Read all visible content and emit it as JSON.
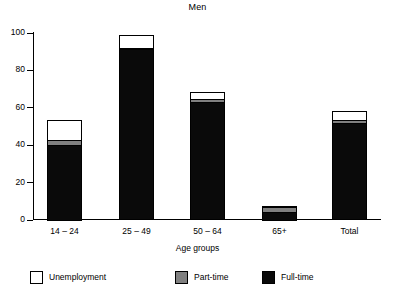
{
  "chart_data": {
    "type": "bar",
    "title": "Men",
    "xlabel": "Age groups",
    "ylabel": "",
    "ylim": [
      0,
      100
    ],
    "yticks": [
      0,
      20,
      40,
      60,
      80,
      100
    ],
    "ytick_labels": [
      "0",
      "20",
      "40",
      "60",
      "80",
      "100"
    ],
    "grid": false,
    "stacked": true,
    "legend_position": "bottom",
    "categories": [
      "14 – 24",
      "25 – 49",
      "50 – 64",
      "65+",
      "Total"
    ],
    "series": [
      {
        "name": "Full-time",
        "color": "#0a0a0a",
        "values": [
          40,
          91,
          63,
          4,
          51.5
        ]
      },
      {
        "name": "Part-time",
        "color": "#808080",
        "values": [
          3,
          1.5,
          2,
          3,
          2
        ]
      },
      {
        "name": "Unemployment",
        "color": "#ffffff",
        "values": [
          11,
          6.5,
          3.5,
          0.5,
          5
        ]
      }
    ],
    "totals": [
      54,
      99,
      68.5,
      7.5,
      58.5
    ]
  },
  "legend": {
    "items": [
      {
        "label": "Unemployment",
        "swatch": "white-swatch-icon"
      },
      {
        "label": "Part-time",
        "swatch": "gray-swatch-icon"
      },
      {
        "label": "Full-time",
        "swatch": "black-swatch-icon"
      }
    ]
  }
}
